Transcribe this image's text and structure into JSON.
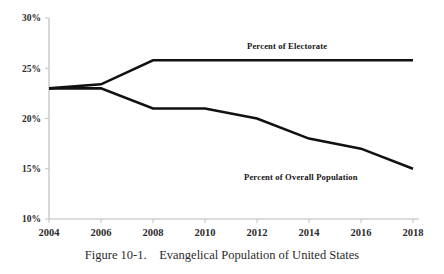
{
  "caption": {
    "figure_number": "Figure 10-1.",
    "figure_title": "Evangelical Population of United States",
    "full_text": "Figure 10-1.    Evangelical Population of United States"
  },
  "chart_data": {
    "type": "line",
    "title": "Evangelical Population of United States",
    "xlabel": "",
    "ylabel": "",
    "x": [
      2004,
      2006,
      2008,
      2010,
      2012,
      2014,
      2016,
      2018
    ],
    "xtick_labels": [
      "2004",
      "2006",
      "2008",
      "2010",
      "2012",
      "2014",
      "2016",
      "2018"
    ],
    "ytick_labels": [
      "30%",
      "25%",
      "20%",
      "15%",
      "10%"
    ],
    "ytick_values": [
      30,
      25,
      20,
      15,
      10
    ],
    "xlim": [
      2004,
      2018
    ],
    "ylim": [
      10,
      30
    ],
    "grid": false,
    "legend_position": "inline-annotation",
    "series": [
      {
        "name": "Percent of Electorate",
        "values": [
          23,
          23.4,
          25.8,
          25.8,
          25.8,
          25.8,
          25.8,
          25.8
        ],
        "color": "#111111",
        "label_text": "Percent of Electorate"
      },
      {
        "name": "Percent of Overall Population",
        "values": [
          23,
          23,
          21,
          21,
          20,
          18,
          17,
          15
        ],
        "color": "#111111",
        "label_text": "Percent of Overall Population"
      }
    ]
  }
}
